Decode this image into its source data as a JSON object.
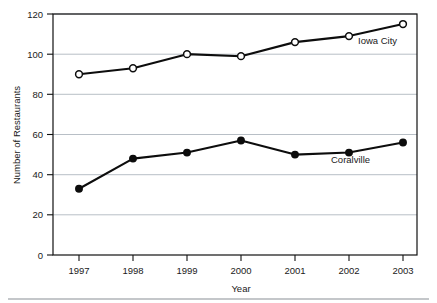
{
  "chart_data": {
    "type": "line",
    "title": "",
    "xlabel": "Year",
    "ylabel": "Number of Restaurants",
    "categories": [
      "1997",
      "1998",
      "1999",
      "2000",
      "2001",
      "2002",
      "2003"
    ],
    "x": [
      1997,
      1998,
      1999,
      2000,
      2001,
      2002,
      2003
    ],
    "xlim": [
      1996.6,
      2003.4
    ],
    "ylim": [
      0,
      120
    ],
    "yticks": [
      0,
      20,
      40,
      60,
      80,
      100,
      120
    ],
    "ytick_labels": [
      "0",
      "20",
      "40",
      "60",
      "80",
      "100",
      "120"
    ],
    "grid": "horizontal",
    "legend_position": "inline-annotation",
    "series": [
      {
        "name": "Iowa City",
        "marker": "open-circle",
        "color": "#0d0d0d",
        "values": [
          90,
          93,
          100,
          99,
          106,
          109,
          115
        ]
      },
      {
        "name": "Coralville",
        "marker": "filled-circle",
        "color": "#0d0d0d",
        "values": [
          33,
          48,
          51,
          57,
          50,
          51,
          56
        ]
      }
    ],
    "annotations": [
      {
        "text": "Iowa City",
        "series": "Iowa City"
      },
      {
        "text": "Coralville",
        "series": "Coralville"
      }
    ]
  },
  "axis": {
    "y_title": "Number of Restaurants",
    "x_title": "Year",
    "y_tick_0": "0",
    "y_tick_20": "20",
    "y_tick_40": "40",
    "y_tick_60": "60",
    "y_tick_80": "80",
    "y_tick_100": "100",
    "y_tick_120": "120",
    "x_tick_1997": "1997",
    "x_tick_1998": "1998",
    "x_tick_1999": "1999",
    "x_tick_2000": "2000",
    "x_tick_2001": "2001",
    "x_tick_2002": "2002",
    "x_tick_2003": "2003"
  },
  "labels": {
    "iowa_city": "Iowa City",
    "coralville": "Coralville"
  },
  "colors": {
    "line": "#0d0d0d",
    "grid": "#9aa3ad",
    "border": "#111111",
    "text": "#1a1a1a",
    "background": "#ffffff"
  }
}
